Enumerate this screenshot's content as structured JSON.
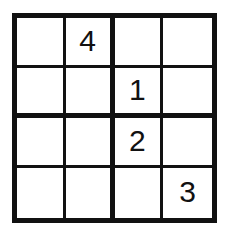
{
  "puzzle": {
    "type": "sudoku-4x4",
    "title": "4x4 Sudoku Grid",
    "size": 4,
    "block_rows": 2,
    "block_cols": 2,
    "colors": {
      "line": "#111111",
      "cell_background": "#ffffff",
      "page_background": "#ffffff",
      "digit": "#111111"
    },
    "empty_cell_label": "",
    "rows": [
      {
        "index": 1,
        "cells": [
          {
            "col": 1,
            "value": "",
            "filled": false
          },
          {
            "col": 2,
            "value": "4",
            "filled": true
          },
          {
            "col": 3,
            "value": "",
            "filled": false
          },
          {
            "col": 4,
            "value": "",
            "filled": false
          }
        ]
      },
      {
        "index": 2,
        "cells": [
          {
            "col": 1,
            "value": "",
            "filled": false
          },
          {
            "col": 2,
            "value": "",
            "filled": false
          },
          {
            "col": 3,
            "value": "1",
            "filled": true
          },
          {
            "col": 4,
            "value": "",
            "filled": false
          }
        ]
      },
      {
        "index": 3,
        "cells": [
          {
            "col": 1,
            "value": "",
            "filled": false
          },
          {
            "col": 2,
            "value": "",
            "filled": false
          },
          {
            "col": 3,
            "value": "2",
            "filled": true
          },
          {
            "col": 4,
            "value": "",
            "filled": false
          }
        ]
      },
      {
        "index": 4,
        "cells": [
          {
            "col": 1,
            "value": "",
            "filled": false
          },
          {
            "col": 2,
            "value": "",
            "filled": false
          },
          {
            "col": 3,
            "value": "",
            "filled": false
          },
          {
            "col": 4,
            "value": "3",
            "filled": true
          }
        ]
      }
    ],
    "given_count": 4,
    "empty_count": 12
  }
}
